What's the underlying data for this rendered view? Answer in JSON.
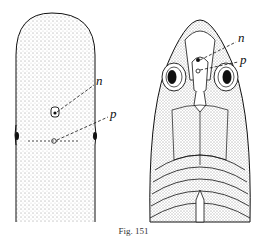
{
  "figure": {
    "labels": {
      "left_n": "n",
      "left_p": "p",
      "right_n": "n",
      "right_p": "p"
    },
    "caption": "Fig. 151"
  }
}
